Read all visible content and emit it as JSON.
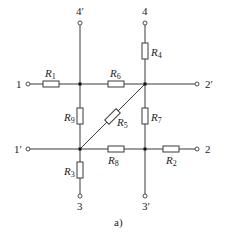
{
  "diagram": {
    "type": "circuit",
    "caption": "a)",
    "terminals": {
      "t4p": "4′",
      "t4": "4",
      "t1": "1",
      "t2p": "2′",
      "t1p": "1′",
      "t2": "2",
      "t3": "3",
      "t3p": "3′"
    },
    "resistors": {
      "R1": {
        "letter": "R",
        "sub": "1"
      },
      "R2": {
        "letter": "R",
        "sub": "2"
      },
      "R3": {
        "letter": "R",
        "sub": "3"
      },
      "R4": {
        "letter": "R",
        "sub": "4"
      },
      "R5": {
        "letter": "R",
        "sub": "5"
      },
      "R6": {
        "letter": "R",
        "sub": "6"
      },
      "R7": {
        "letter": "R",
        "sub": "7"
      },
      "R8": {
        "letter": "R",
        "sub": "8"
      },
      "R9": {
        "letter": "R",
        "sub": "9"
      }
    },
    "connections": [
      "1 - R1 - nodeA",
      "nodeA - R6 - nodeB",
      "nodeB - 2′",
      "4′ - nodeA",
      "4 - R4 - nodeB",
      "nodeA - R9 - nodeC",
      "nodeB - R7 - nodeD",
      "nodeC - R5 - nodeB",
      "1′ - nodeC",
      "nodeC - R8 - nodeD",
      "nodeD - R2 - 2",
      "nodeC - R3 - 3",
      "nodeD - 3′"
    ]
  }
}
